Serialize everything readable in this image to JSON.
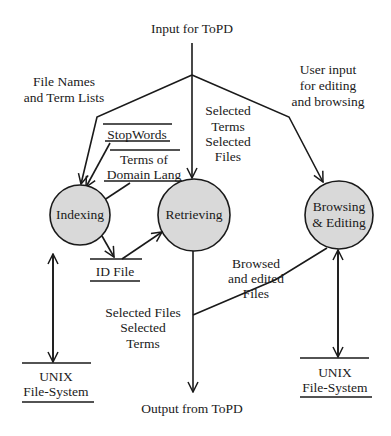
{
  "diagram": {
    "type": "data-flow diagram",
    "io": {
      "input": "Input for ToPD",
      "output": "Output from ToPD"
    },
    "processes": [
      {
        "id": "indexing",
        "label": "Indexing"
      },
      {
        "id": "retrieving",
        "label": "Retrieving"
      },
      {
        "id": "browsing",
        "label_line1": "Browsing",
        "label_line2": "& Editing"
      }
    ],
    "data_stores": {
      "stopwords": "StopWords",
      "terms_line1": "Terms of",
      "terms_line2": "Domain Lang",
      "id_file": "ID File",
      "unix_left_line1": "UNIX",
      "unix_left_line2": "File-System",
      "unix_right_line1": "UNIX",
      "unix_right_line2": "File-System"
    },
    "flow_labels": {
      "file_names_line1": "File Names",
      "file_names_line2": "and Term Lists",
      "selected_in_line1": "Selected",
      "selected_in_line2": "Terms",
      "selected_in_line3": "Selected",
      "selected_in_line4": "Files",
      "user_input_line1": "User input",
      "user_input_line2": "for editing",
      "user_input_line3": "and browsing",
      "browsed_line1": "Browsed",
      "browsed_line2": "and edited",
      "browsed_line3": "Files",
      "selected_out_line1": "Selected Files",
      "selected_out_line2": "Selected",
      "selected_out_line3": "Terms"
    },
    "colors": {
      "process_fill": "#d9d9d9",
      "stroke": "#1a1a1a",
      "background": "#ffffff"
    }
  }
}
